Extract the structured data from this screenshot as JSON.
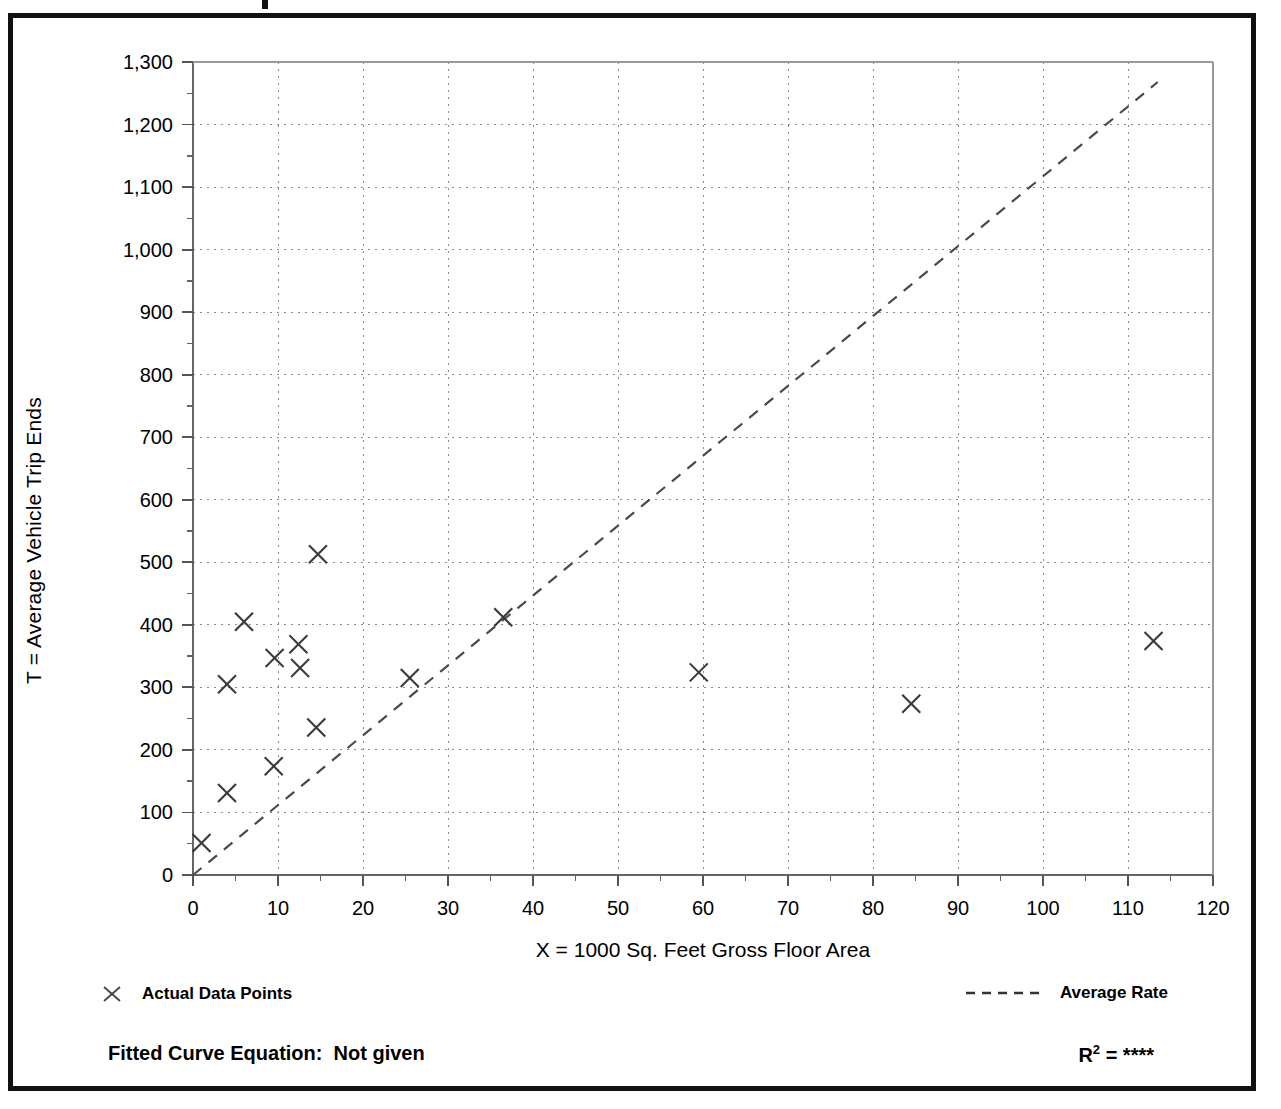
{
  "figure": {
    "ylabel": "T = Average Vehicle Trip Ends",
    "xlabel": "X = 1000 Sq. Feet Gross Floor Area"
  },
  "legend": {
    "data_points_label": "Actual Data Points",
    "average_rate_label": "Average Rate",
    "marker_icon": "x-marker-icon",
    "line_icon": "dashed-line-icon"
  },
  "footer": {
    "fitted_curve_label": "Fitted Curve Equation:  Not given",
    "r_squared_label": "R",
    "r_squared_exp": "2",
    "r_squared_value": "= ****"
  },
  "colors": {
    "frame": "#111111",
    "axis": "#555555",
    "grid": "#888888",
    "marker": "#333333",
    "trend": "#444444",
    "background": "#ffffff"
  },
  "chart_data": {
    "type": "scatter",
    "title": "",
    "xlabel": "X = 1000 Sq. Feet Gross Floor Area",
    "ylabel": "T = Average Vehicle Trip Ends",
    "xlim": [
      0,
      120
    ],
    "ylim": [
      0,
      1300
    ],
    "xticks": [
      0,
      10,
      20,
      30,
      40,
      50,
      60,
      70,
      80,
      90,
      100,
      110,
      120
    ],
    "xtick_labels": [
      "0",
      "10",
      "20",
      "30",
      "40",
      "50",
      "60",
      "70",
      "80",
      "90",
      "100",
      "110",
      "120"
    ],
    "xtick_minor_step": 5,
    "yticks": [
      0,
      100,
      200,
      300,
      400,
      500,
      600,
      700,
      800,
      900,
      1000,
      1100,
      1200,
      1300
    ],
    "ytick_labels": [
      "0",
      "100",
      "200",
      "300",
      "400",
      "500",
      "600",
      "700",
      "800",
      "900",
      "1,000",
      "1,100",
      "1,200",
      "1,300"
    ],
    "ytick_minor_step": 50,
    "grid": true,
    "grid_style": "dotted",
    "legend_position": "below-axes",
    "series": [
      {
        "name": "Actual Data Points",
        "marker": "x",
        "points": [
          {
            "x": 1.0,
            "y": 51
          },
          {
            "x": 4.0,
            "y": 131
          },
          {
            "x": 4.0,
            "y": 305
          },
          {
            "x": 6.0,
            "y": 405
          },
          {
            "x": 9.5,
            "y": 174
          },
          {
            "x": 9.6,
            "y": 347
          },
          {
            "x": 12.4,
            "y": 369
          },
          {
            "x": 12.6,
            "y": 331
          },
          {
            "x": 14.5,
            "y": 236
          },
          {
            "x": 14.7,
            "y": 513
          },
          {
            "x": 25.5,
            "y": 315
          },
          {
            "x": 36.5,
            "y": 412
          },
          {
            "x": 59.5,
            "y": 324
          },
          {
            "x": 84.5,
            "y": 274
          },
          {
            "x": 113.0,
            "y": 374
          }
        ]
      },
      {
        "name": "Average Rate",
        "type": "line",
        "style": "dashed",
        "endpoints": [
          {
            "x": 0,
            "y": 0
          },
          {
            "x": 113.5,
            "y": 1268
          }
        ],
        "slope": 11.17
      }
    ]
  }
}
